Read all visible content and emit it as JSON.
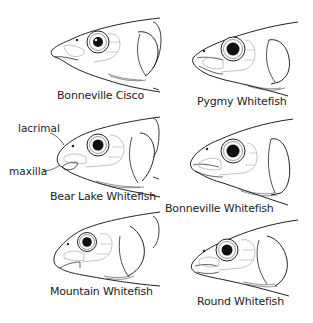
{
  "figure": {
    "panels": [
      {
        "id": "bonneville-cisco",
        "label": "Bonneville Cisco",
        "position": "top-left"
      },
      {
        "id": "pygmy-whitefish",
        "label": "Pygmy Whitefish",
        "position": "top-right"
      },
      {
        "id": "bear-lake-whitefish",
        "label": "Bear Lake Whitefish",
        "position": "middle-left"
      },
      {
        "id": "bonneville-whitefish",
        "label": "Bonneville Whitefish",
        "position": "middle-right"
      },
      {
        "id": "mountain-whitefish",
        "label": "Mountain Whitefish",
        "position": "bottom-left"
      },
      {
        "id": "round-whitefish",
        "label": "Round Whitefish",
        "position": "bottom-right"
      }
    ],
    "annotations": {
      "lacrimal": "lacrimal",
      "maxilla": "maxilla"
    },
    "colors": {
      "line": "#222222",
      "light_line": "#888888",
      "background": "#ffffff"
    }
  }
}
